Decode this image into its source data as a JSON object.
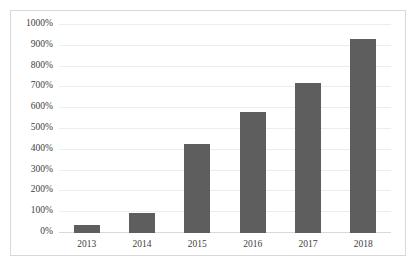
{
  "chart_data": {
    "type": "bar",
    "title": "",
    "subtitle": "",
    "xlabel": "",
    "ylabel": "",
    "categories": [
      "2013",
      "2014",
      "2015",
      "2016",
      "2017",
      "2018"
    ],
    "values": [
      40,
      95,
      430,
      580,
      720,
      935
    ],
    "value_suffix": "%",
    "ylim": [
      0,
      1000
    ],
    "ytick_step": 100,
    "ytick_labels": [
      "0%",
      "100%",
      "200%",
      "300%",
      "400%",
      "500%",
      "600%",
      "700%",
      "800%",
      "900%",
      "1000%"
    ],
    "ytick_values": [
      0,
      100,
      200,
      300,
      400,
      500,
      600,
      700,
      800,
      900,
      1000
    ],
    "grid": true,
    "grid_axis": "y",
    "legend": false,
    "legend_position": "none",
    "series": [
      {
        "name": "",
        "values": [
          40,
          95,
          430,
          580,
          720,
          935
        ]
      }
    ],
    "colors": {
      "bar": "#5e5e5e",
      "gridline": "#ededed",
      "axis": "#d9d9d9",
      "border": "#d8d8d8",
      "background": "#ffffff",
      "text": "#404040"
    }
  }
}
